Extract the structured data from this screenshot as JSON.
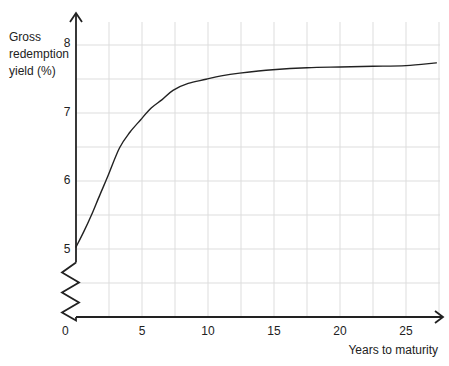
{
  "chart_data": {
    "type": "line",
    "title": "",
    "xlabel": "Years to maturity",
    "ylabel": "Gross redemption yield (%)",
    "ylabel_lines": [
      "Gross",
      "redemption",
      "yield (%)"
    ],
    "x_ticks": [
      0,
      5,
      10,
      15,
      20,
      25
    ],
    "x_tick_labels": [
      "0",
      "5",
      "10",
      "15",
      "20",
      "25"
    ],
    "y_ticks": [
      5,
      6,
      7,
      8
    ],
    "y_tick_labels": [
      "5",
      "6",
      "7",
      "8"
    ],
    "x_origin_label": "0",
    "xlim": [
      0,
      28
    ],
    "ylim": [
      4,
      8.45
    ],
    "y_axis_break": true,
    "grid": true,
    "grid_x_step": 2.5,
    "grid_y_step": 0.5,
    "legend": null,
    "series": [
      {
        "name": "Yield curve",
        "color": "#222222",
        "x": [
          0,
          0.6,
          1.2,
          1.8,
          2.4,
          3.3,
          4.1,
          4.9,
          5.7,
          6.5,
          7.35,
          8.5,
          9.85,
          11.0,
          12.4,
          14.9,
          17.5,
          20.0,
          22.5,
          25.0,
          27.3
        ],
        "y": [
          5.02,
          5.25,
          5.5,
          5.78,
          6.05,
          6.47,
          6.7,
          6.88,
          7.05,
          7.17,
          7.31,
          7.41,
          7.47,
          7.52,
          7.56,
          7.61,
          7.64,
          7.65,
          7.66,
          7.67,
          7.71
        ]
      }
    ]
  },
  "colors": {
    "axis": "#222222",
    "grid": "#dddddd",
    "curve": "#222222",
    "background": "#ffffff"
  }
}
